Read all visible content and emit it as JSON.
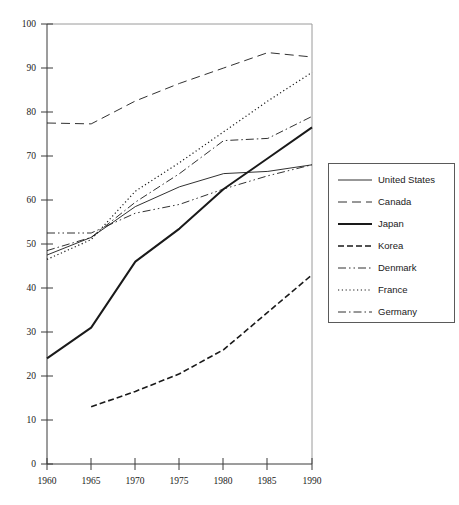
{
  "chart_data": {
    "type": "line",
    "title": "",
    "xlabel": "",
    "ylabel": "",
    "x": [
      1960,
      1965,
      1970,
      1975,
      1980,
      1985,
      1990
    ],
    "xtick_labels": [
      "1960",
      "1965",
      "1970",
      "1975",
      "1980",
      "1985",
      "1990"
    ],
    "ytick_labels": [
      "0",
      "10",
      "20",
      "30",
      "40",
      "50",
      "60",
      "70",
      "80",
      "90",
      "100"
    ],
    "ytick_values": [
      0,
      10,
      20,
      30,
      40,
      50,
      60,
      70,
      80,
      90,
      100
    ],
    "xlim": [
      1960,
      1990
    ],
    "ylim": [
      0,
      100
    ],
    "grid": false,
    "legend_position": "right",
    "series": [
      {
        "name": "United States",
        "style": "solid-thin",
        "color": "#1a1a1a",
        "x": [
          1960,
          1965,
          1970,
          1975,
          1980,
          1985,
          1990
        ],
        "values": [
          47.5,
          51.5,
          58.5,
          63.0,
          66.0,
          66.5,
          68.0
        ]
      },
      {
        "name": "Canada",
        "style": "long-dash",
        "color": "#1a1a1a",
        "x": [
          1960,
          1965,
          1970,
          1975,
          1980,
          1985,
          1990
        ],
        "values": [
          77.5,
          77.3,
          82.5,
          86.5,
          90.0,
          93.5,
          92.5
        ]
      },
      {
        "name": "Japan",
        "style": "solid-thick",
        "color": "#1a1a1a",
        "x": [
          1960,
          1965,
          1970,
          1975,
          1980,
          1985,
          1990
        ],
        "values": [
          24.0,
          31.0,
          46.0,
          53.5,
          62.5,
          69.5,
          76.5
        ]
      },
      {
        "name": "Korea",
        "style": "dash",
        "color": "#1a1a1a",
        "x": [
          1965,
          1970,
          1975,
          1980,
          1985,
          1990
        ],
        "values": [
          13.0,
          16.5,
          20.5,
          26.0,
          34.5,
          43.0
        ]
      },
      {
        "name": "Denmark",
        "style": "dash-dot-dot",
        "color": "#1a1a1a",
        "x": [
          1960,
          1965,
          1970,
          1975,
          1980,
          1985,
          1990
        ],
        "values": [
          52.5,
          52.5,
          57.0,
          59.0,
          62.5,
          65.5,
          68.0
        ]
      },
      {
        "name": "France",
        "style": "dotted",
        "color": "#1a1a1a",
        "x": [
          1960,
          1965,
          1970,
          1975,
          1980,
          1985,
          1990
        ],
        "values": [
          46.5,
          51.0,
          62.0,
          68.5,
          75.5,
          82.5,
          89.0
        ]
      },
      {
        "name": "Germany",
        "style": "dash-dot",
        "color": "#1a1a1a",
        "x": [
          1960,
          1965,
          1970,
          1975,
          1980,
          1985,
          1990
        ],
        "values": [
          48.5,
          51.5,
          59.5,
          66.0,
          73.5,
          74.0,
          79.0
        ]
      }
    ]
  },
  "legend": {
    "entries": [
      {
        "label": "United States"
      },
      {
        "label": "Canada"
      },
      {
        "label": "Japan"
      },
      {
        "label": "Korea"
      },
      {
        "label": "Denmark"
      },
      {
        "label": "France"
      },
      {
        "label": "Germany"
      }
    ]
  },
  "axis": {
    "y_labels": [
      "100",
      "90",
      "80",
      "70",
      "60",
      "50",
      "40",
      "30",
      "20",
      "10",
      "0"
    ],
    "x_labels": [
      "1960",
      "1965",
      "1970",
      "1975",
      "1980",
      "1985",
      "1990"
    ]
  }
}
